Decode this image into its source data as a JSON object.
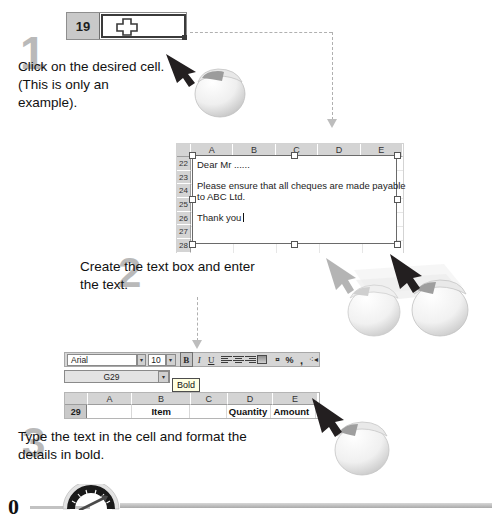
{
  "doc": {
    "title": "Spreadsheet text box and bold formatting tutorial"
  },
  "step1": {
    "number": "1",
    "text": "Click on the desired cell. (This is only an example).",
    "cell": {
      "row_label": "19",
      "content": "",
      "cursor_icon": "cross-cursor"
    },
    "mouse_icon": "mouse-left-click-icon",
    "arrow_icon": "black-arrow-icon"
  },
  "step2": {
    "number": "2",
    "text": "Create the text box and enter the text.",
    "sheet": {
      "columns": [
        "A",
        "B",
        "C",
        "D",
        "E"
      ],
      "rows": [
        "22",
        "23",
        "24",
        "25",
        "26",
        "27",
        "28"
      ]
    },
    "textbox": {
      "line1": "Dear Mr ......",
      "line2": "Please ensure that all cheques are made payable",
      "line3": "to ABC Ltd.",
      "line4": "Thank you"
    },
    "mouse_icon": "mouse-drag-icon",
    "arrow_icon": "black-arrow-icon"
  },
  "step3": {
    "number": "3",
    "text": "Type the text in the cell and format the details in bold.",
    "toolbar": {
      "font_name": "Arial",
      "font_size": "10",
      "buttons": [
        {
          "name": "bold-button",
          "label": "B",
          "active": true
        },
        {
          "name": "italic-button",
          "label": "I",
          "active": false
        },
        {
          "name": "underline-button",
          "label": "U",
          "active": false
        },
        {
          "name": "align-left-button",
          "label": "",
          "active": false
        },
        {
          "name": "align-center-button",
          "label": "",
          "active": false
        },
        {
          "name": "align-right-button",
          "label": "",
          "active": false
        },
        {
          "name": "merge-center-button",
          "label": "",
          "active": false
        },
        {
          "name": "currency-button",
          "label": "",
          "active": false
        },
        {
          "name": "percent-button",
          "label": "%",
          "active": false
        },
        {
          "name": "comma-button",
          "label": ",",
          "active": false
        },
        {
          "name": "decrease-decimal-button",
          "label": "",
          "active": false
        }
      ],
      "tooltip": "Bold"
    },
    "name_box": "G29",
    "sheet": {
      "columns": [
        "A",
        "B",
        "C",
        "D",
        "E"
      ],
      "row_label": "29",
      "cells": [
        "",
        "Item",
        "",
        "Quantity",
        "Amount"
      ]
    },
    "mouse_icon": "mouse-left-click-icon",
    "arrow_icon": "black-arrow-icon"
  },
  "footer": {
    "page_number": "0",
    "gauge_icon": "speedometer-gauge-icon"
  },
  "colors": {
    "step_number": "#b9b9b9",
    "header_gray": "#d4d4d4",
    "rowhdr_gray": "#c9c9c9",
    "dashed_line": "#b0b0b0",
    "tooltip_bg": "#ffffe1"
  }
}
